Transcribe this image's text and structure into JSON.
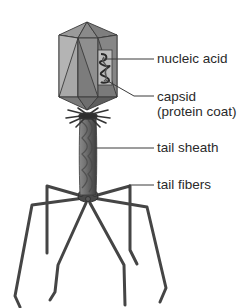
{
  "diagram": {
    "colors": {
      "capsid_light": "#a9a9a9",
      "capsid_mid": "#8c8c8c",
      "capsid_dark": "#6e6e6e",
      "outline": "#3a3a3a",
      "tail": "#6a6a6a",
      "fiber": "#4a4a4a",
      "text": "#2a2a2a",
      "leader": "#3a3a3a"
    },
    "labels": [
      {
        "id": "nucleic-acid",
        "text": "nucleic acid"
      },
      {
        "id": "capsid",
        "text": "capsid"
      },
      {
        "id": "capsid-sub",
        "text": "(protein coat)"
      },
      {
        "id": "tail-sheath",
        "text": "tail sheath"
      },
      {
        "id": "tail-fibers",
        "text": "tail fibers"
      }
    ]
  }
}
